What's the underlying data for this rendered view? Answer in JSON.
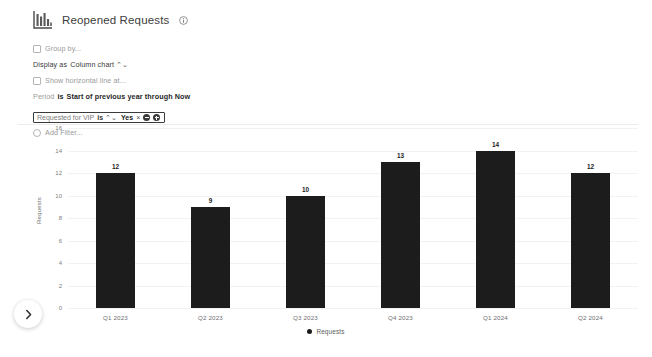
{
  "header": {
    "title": "Reopened Requests",
    "chart_icon": "bar-chart-icon",
    "info_icon": "info-circle-icon"
  },
  "controls": {
    "group_by": {
      "label": "Group by...",
      "checked": false,
      "icon": "checkbox-icon"
    },
    "display_as": {
      "prefix": "Display as",
      "value": "Column chart",
      "caret": "⌃⌄"
    },
    "horizontal_line": {
      "label": "Show horizontal line at...",
      "checked": false,
      "icon": "checkbox-icon"
    },
    "period": {
      "field": "Period",
      "op": "is",
      "value": "Start of previous year through Now"
    },
    "filter": {
      "field": "Requested for VIP",
      "op": "is",
      "caret": "⌃⌄",
      "value": "Yes",
      "remove": "×",
      "minus_icon": "minus-circle-icon",
      "plus_icon": "plus-circle-icon"
    },
    "add_filter": {
      "label": "Add Filter...",
      "icon": "radio-icon"
    }
  },
  "nav": {
    "next_icon": "chevron-right-icon"
  },
  "chart_data": {
    "type": "bar",
    "title": "Reopened Requests",
    "categories": [
      "Q1 2023",
      "Q2 2023",
      "Q3 2023",
      "Q4 2023",
      "Q1 2024",
      "Q2 2024"
    ],
    "values": [
      12,
      9,
      10,
      13,
      14,
      12
    ],
    "series": [
      {
        "name": "Requests",
        "values": [
          12,
          9,
          10,
          13,
          14,
          12
        ],
        "color": "#1c1c1c"
      }
    ],
    "xlabel": "",
    "ylabel": "Requests",
    "ylim": [
      0,
      16
    ],
    "yticks": [
      16,
      14,
      12,
      10,
      8,
      6,
      4,
      2,
      0
    ],
    "grid": true,
    "legend": {
      "position": "bottom",
      "entries": [
        "Requests"
      ]
    },
    "bar_color": "#1c1c1c",
    "show_value_labels": true
  }
}
